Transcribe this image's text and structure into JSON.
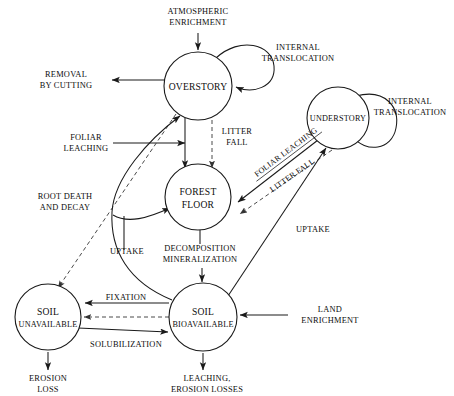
{
  "diagram": {
    "colors": {
      "stroke": "#1a1a1a",
      "dashed_stroke": "#4a4a4a",
      "background": "#ffffff"
    },
    "nodes": [
      {
        "id": "overstory",
        "label": "OVERSTORY",
        "cx": 198,
        "cy": 86,
        "r": 34
      },
      {
        "id": "understory",
        "label": "UNDERSTORY",
        "cx": 338,
        "cy": 118,
        "r": 31
      },
      {
        "id": "forest_floor",
        "label_line1": "FOREST",
        "label_line2": "FLOOR",
        "cx": 198,
        "cy": 197,
        "r": 33
      },
      {
        "id": "soil_unavailable",
        "label_line1": "SOIL",
        "label_line2": "UNAVAILABLE",
        "cx": 48,
        "cy": 317,
        "r": 33
      },
      {
        "id": "soil_bioavailable",
        "label_line1": "SOIL",
        "label_line2": "BIOAVAILABLE",
        "cx": 203,
        "cy": 317,
        "r": 34
      }
    ],
    "flows": [
      {
        "id": "atmospheric-enrichment",
        "line1": "ATMOSPHERIC",
        "line2": "ENRICHMENT",
        "style": "solid"
      },
      {
        "id": "internal-translocation-overstory",
        "line1": "INTERNAL",
        "line2": "TRANSLOCATION",
        "style": "solid"
      },
      {
        "id": "internal-translocation-understory",
        "line1": "INTERNAL",
        "line2": "TRANSLOCATION",
        "style": "solid"
      },
      {
        "id": "removal-by-cutting",
        "line1": "REMOVAL",
        "line2": "BY CUTTING",
        "style": "solid"
      },
      {
        "id": "foliar-leaching-overstory",
        "line1": "FOLIAR",
        "line2": "LEACHING",
        "style": "solid"
      },
      {
        "id": "root-death-and-decay",
        "line1": "ROOT DEATH",
        "line2": "AND DECAY",
        "style": "dashed"
      },
      {
        "id": "litter-fall-overstory",
        "line1": "LITTER",
        "line2": "FALL",
        "style": "solid"
      },
      {
        "id": "uptake-left",
        "line1": "UPTAKE",
        "line2": "",
        "style": "solid"
      },
      {
        "id": "uptake-right",
        "line1": "UPTAKE",
        "line2": "",
        "style": "solid"
      },
      {
        "id": "foliar-leaching-understory",
        "line1": "FOLIAR LEACHING",
        "line2": "",
        "style": "solid"
      },
      {
        "id": "litter-fall-understory",
        "line1": "LITTER FALL",
        "line2": "",
        "style": "dashed"
      },
      {
        "id": "decomposition-mineralization",
        "line1": "DECOMPOSITION",
        "line2": "MINERALIZATION",
        "style": "solid"
      },
      {
        "id": "fixation",
        "line1": "FIXATION",
        "line2": "",
        "style": "solid"
      },
      {
        "id": "solubilization",
        "line1": "SOLUBILIZATION",
        "line2": "",
        "style": "solid"
      },
      {
        "id": "land-enrichment",
        "line1": "LAND",
        "line2": "ENRICHMENT",
        "style": "solid"
      },
      {
        "id": "erosion-loss",
        "line1": "EROSION",
        "line2": "LOSS",
        "style": "solid"
      },
      {
        "id": "leaching-erosion-losses",
        "line1": "LEACHING,",
        "line2": "EROSION LOSSES",
        "style": "solid"
      }
    ]
  }
}
